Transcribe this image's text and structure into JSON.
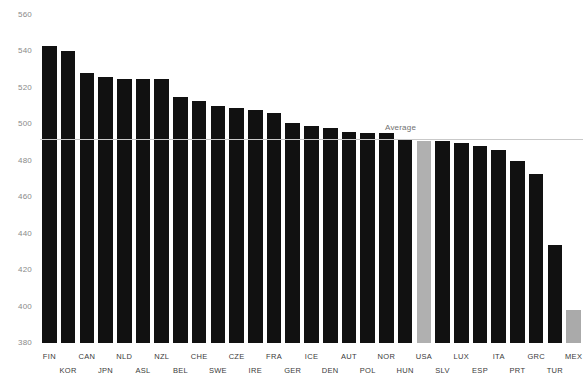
{
  "chart_data": {
    "type": "bar",
    "title": "",
    "subtitle": "",
    "xlabel": "",
    "ylabel": "",
    "ylim": [
      380,
      560
    ],
    "yticks": [
      380,
      400,
      420,
      440,
      460,
      480,
      500,
      520,
      540,
      560
    ],
    "grid": false,
    "legend": null,
    "categories": [
      "FIN",
      "KOR",
      "CAN",
      "JPN",
      "NLD",
      "ASL",
      "NZL",
      "BEL",
      "CHE",
      "SWE",
      "CZE",
      "IRE",
      "FRA",
      "GER",
      "ICE",
      "DEN",
      "AUT",
      "POL",
      "NOR",
      "HUN",
      "USA",
      "SLV",
      "LUX",
      "ESP",
      "ITA",
      "PRT",
      "GRC",
      "TUR",
      "MEX"
    ],
    "values": [
      543,
      540,
      528,
      526,
      525,
      525,
      525,
      515,
      513,
      510,
      509,
      508,
      506,
      501,
      499,
      498,
      496,
      495,
      495,
      492,
      491,
      491,
      490,
      488,
      486,
      480,
      473,
      434,
      398
    ],
    "bar_colors": [
      "#111111",
      "#111111",
      "#111111",
      "#111111",
      "#111111",
      "#111111",
      "#111111",
      "#111111",
      "#111111",
      "#111111",
      "#111111",
      "#111111",
      "#111111",
      "#111111",
      "#111111",
      "#111111",
      "#111111",
      "#111111",
      "#111111",
      "#111111",
      "#b0b0b0",
      "#111111",
      "#111111",
      "#111111",
      "#111111",
      "#111111",
      "#111111",
      "#111111",
      "#aaaaaa"
    ],
    "annotations": [
      {
        "name": "average-line",
        "label": "Average",
        "value": 492,
        "line_color": "#c9c9c9",
        "label_color": "#6f6f6f"
      }
    ],
    "highlight_color": "#b0b0b0",
    "bar_color": "#111111",
    "background_color": "#ffffff",
    "tick_label_color": "#8a8a8a"
  }
}
